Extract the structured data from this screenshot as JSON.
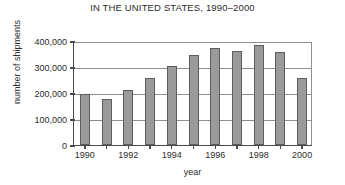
{
  "chart_data": {
    "type": "bar",
    "title": "IN THE UNITED STATES, 1990–2000",
    "xlabel": "year",
    "ylabel": "number of shipments",
    "categories": [
      "1990",
      "1991",
      "1992",
      "1993",
      "1994",
      "1995",
      "1996",
      "1997",
      "1998",
      "1999",
      "2000"
    ],
    "values": [
      196000,
      177000,
      212000,
      258000,
      304000,
      346000,
      373000,
      362000,
      385000,
      358000,
      258000
    ],
    "ylim": [
      0,
      400000
    ],
    "ytick_labels": [
      "0",
      "100,000",
      "200,000",
      "300,000",
      "400,000"
    ],
    "ytick_values": [
      0,
      100000,
      200000,
      300000,
      400000
    ],
    "xtick_labels": [
      "1990",
      "1992",
      "1994",
      "1996",
      "1998",
      "2000"
    ],
    "xtick_categories": [
      "1990",
      "1992",
      "1994",
      "1996",
      "1998",
      "2000"
    ],
    "grid": "horizontal",
    "legend": "none",
    "bar_color": "#9a9a9a",
    "bar_edge_color": "#5d5d5d",
    "axis_color": "#4a4a4a",
    "grid_color": "#8e8e8e",
    "text_color": "#2b2b2b"
  }
}
